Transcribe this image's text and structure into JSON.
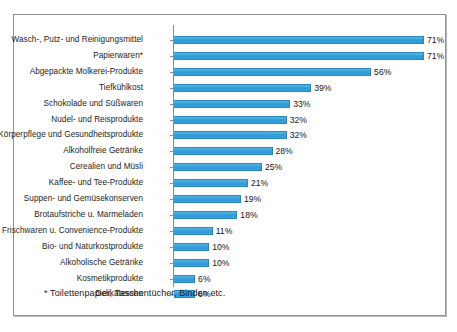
{
  "figure": {
    "footnote": "* Toilettenpapier, Taschentücher, Binden etc.",
    "bar_color": "#35a4dd",
    "bar_border_color": "#2f86b6",
    "frame_border_color": "#8e8e96",
    "background": "#ffffff"
  },
  "chart_data": {
    "type": "bar",
    "orientation": "horizontal",
    "title": "",
    "subtitle": "",
    "xlabel": "",
    "ylabel": "",
    "xlim": [
      0,
      75
    ],
    "grid": false,
    "legend": false,
    "value_suffix": "%",
    "annotations": [
      "* Toilettenpapier, Taschentücher, Binden etc."
    ],
    "categories": [
      "Wasch-, Putz- und Reinigungsmittel",
      "Papierwaren*",
      "Abgepackte Molkerei-Produkte",
      "Tiefkühlkost",
      "Schokolade und Süßwaren",
      "Nudel- und Reisprodukte",
      "Körperpflege und Gesundheitsprodukte",
      "Alkoholfreie Getränke",
      "Cerealien und Müsli",
      "Kaffee- und Tee-Produkte",
      "Suppen- und Gemüsekonserven",
      "Brotaufstriche u. Marmeladen",
      "Frischwaren u. Convenience-Produkte",
      "Bio- und Naturkostprodukte",
      "Alkoholische Getränke",
      "Kosmetikprodukte",
      "Delikatessen"
    ],
    "values": [
      71,
      71,
      56,
      39,
      33,
      32,
      32,
      28,
      25,
      21,
      19,
      18,
      11,
      10,
      10,
      6,
      6
    ],
    "value_labels": [
      "71%",
      "71%",
      "56%",
      "39%",
      "33%",
      "32%",
      "32%",
      "28%",
      "25%",
      "21%",
      "19%",
      "18%",
      "11%",
      "10%",
      "10%",
      "6%",
      "6%"
    ]
  }
}
